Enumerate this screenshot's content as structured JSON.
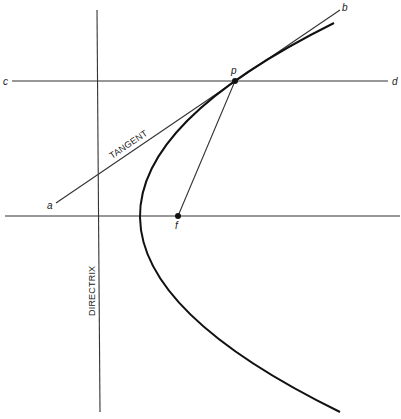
{
  "figure": {
    "colors": {
      "background": "#ffffff",
      "ink": "#1a1a1a",
      "thin_line": "#333333"
    },
    "labels": {
      "point_a": "a",
      "point_b": "b",
      "point_c": "c",
      "point_d": "d",
      "point_p": "p",
      "point_f": "f",
      "tangent": "TANGENT",
      "directrix": "DIRECTRIX"
    },
    "elements": {
      "directrix_line": {
        "x1": 97,
        "y1": 10,
        "x2": 100,
        "y2": 412
      },
      "axis_line": {
        "x1": 5,
        "y1": 216,
        "x2": 400,
        "y2": 216
      },
      "line_cd": {
        "x1": 12,
        "y1": 81,
        "x2": 388,
        "y2": 81
      },
      "tangent_ab": {
        "x1": 56,
        "y1": 203,
        "x2": 340,
        "y2": 10
      },
      "focal_segment_pf": {
        "x1": 235,
        "y1": 81,
        "x2": 178,
        "y2": 216
      },
      "parabola": {
        "start": [
          334,
          23
        ],
        "control": [
          -57,
          217.5
        ],
        "end": [
          340,
          412
        ],
        "vertex": [
          140,
          216
        ]
      },
      "point_p": {
        "x": 235,
        "y": 81
      },
      "focus_f": {
        "x": 178,
        "y": 216
      }
    }
  }
}
